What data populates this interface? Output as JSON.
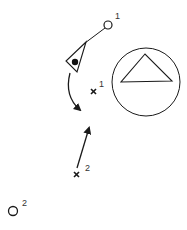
{
  "diagram": {
    "markers": {
      "circle_1": {
        "label": "1"
      },
      "circle_2": {
        "label": "2"
      },
      "cross_1": {
        "label": "1"
      },
      "cross_2": {
        "label": "2"
      }
    },
    "elements": [
      {
        "type": "open-circle",
        "label": "1",
        "description": "start position 1"
      },
      {
        "type": "pointer-triangle",
        "description": "triangular pointer with filled dot, connected by line to circle 1"
      },
      {
        "type": "curved-arrow",
        "description": "curved arrow sweeping downward from pointer"
      },
      {
        "type": "cross",
        "label": "1"
      },
      {
        "type": "circle-with-triangle",
        "description": "large circle containing a triangle"
      },
      {
        "type": "arrow",
        "description": "straight arrow from cross 2 pointing up"
      },
      {
        "type": "cross",
        "label": "2"
      },
      {
        "type": "open-circle",
        "label": "2"
      }
    ],
    "colors": {
      "stroke": "#1a1a1a",
      "label": "#333333",
      "background": "#ffffff"
    }
  }
}
